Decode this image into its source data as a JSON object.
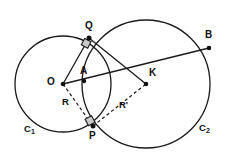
{
  "figure": {
    "background_color": "#ffffff",
    "stroke_color": "#1a1a1a",
    "marker_fill_color": "#c9c9c9",
    "width": 226,
    "height": 158
  },
  "circles": [
    {
      "name": "C1",
      "label": "C",
      "label_sub": "1",
      "center_label": "O",
      "cx": 63,
      "cy": 84,
      "r": 48,
      "label_x": 25,
      "label_y": 126
    },
    {
      "name": "C2",
      "label": "C",
      "label_sub": "2",
      "center_label": "K",
      "cx": 146,
      "cy": 84,
      "r": 64,
      "label_x": 200,
      "label_y": 125
    }
  ],
  "points": [
    {
      "id": "O",
      "label": "O",
      "x": 63,
      "y": 84,
      "label_x": 49,
      "label_y": 79,
      "dot": true
    },
    {
      "id": "K",
      "label": "K",
      "x": 146,
      "y": 84,
      "label_x": 150,
      "label_y": 70,
      "dot": true
    },
    {
      "id": "Q",
      "label": "Q",
      "x": 89,
      "y": 38,
      "label_x": 85,
      "label_y": 23,
      "dot": true
    },
    {
      "id": "P",
      "label": "P",
      "x": 93,
      "y": 126,
      "label_x": 89,
      "label_y": 133,
      "dot": true
    },
    {
      "id": "A",
      "label": "A",
      "x": 84,
      "y": 81,
      "label_x": 80,
      "label_y": 67,
      "dot": true
    },
    {
      "id": "B",
      "label": "B",
      "x": 209,
      "y": 48,
      "label_x": 206,
      "label_y": 33,
      "dot": true
    }
  ],
  "segments": [
    {
      "id": "O-Q",
      "from": "O",
      "to": "Q",
      "style": "solid"
    },
    {
      "id": "O-B",
      "from": "O",
      "to": "B",
      "style": "solid"
    },
    {
      "id": "Q-K",
      "from": "Q",
      "to": "K",
      "style": "solid"
    },
    {
      "id": "O-P",
      "from": "O",
      "to": "P",
      "style": "dashed",
      "label": "R"
    },
    {
      "id": "P-K",
      "from": "P",
      "to": "K",
      "style": "dashed",
      "label": "R'"
    }
  ],
  "radius_labels": [
    {
      "id": "R",
      "text": "R",
      "x": 63,
      "y": 100
    },
    {
      "id": "Rprime",
      "text": "R'",
      "x": 120,
      "y": 103
    }
  ],
  "right_angle_marks": [
    {
      "id": "right-angle-at-Q",
      "x": 89,
      "y": 38,
      "angle_deg": 28
    },
    {
      "id": "right-angle-at-P",
      "x": 93,
      "y": 126,
      "angle_deg": -28
    }
  ]
}
